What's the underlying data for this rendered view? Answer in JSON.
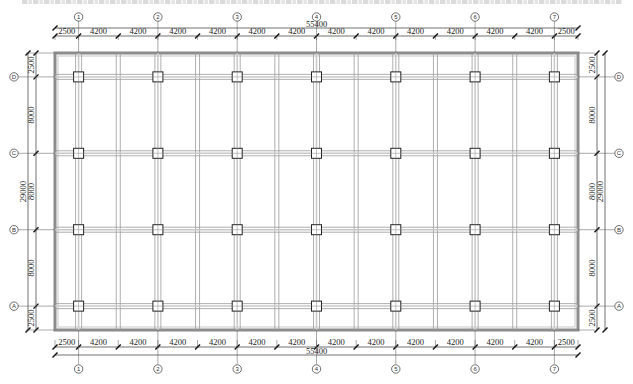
{
  "drawing": {
    "type": "structural floor grid plan",
    "colors": {
      "line": "#333333",
      "beam": "#9a9a9a",
      "beam_light": "#c8c8c8",
      "slab_edge": "#8c8c8c",
      "column": "#222222",
      "text": "#222222"
    },
    "x_axes": [
      "1",
      "2",
      "3",
      "4",
      "5",
      "6",
      "7"
    ],
    "y_axes": [
      "D",
      "C",
      "B",
      "A"
    ],
    "top_dimensions": {
      "segments": [
        "2500",
        "4200",
        "4200",
        "4200",
        "4200",
        "4200",
        "4200",
        "4200",
        "4200",
        "4200",
        "4200",
        "4200",
        "4200",
        "2500"
      ],
      "total": "55400"
    },
    "bottom_dimensions": {
      "segments": [
        "2500",
        "4200",
        "4200",
        "4200",
        "4200",
        "4200",
        "4200",
        "4200",
        "4200",
        "4200",
        "4200",
        "4200",
        "4200",
        "2500"
      ],
      "total": "55400"
    },
    "left_dimensions": {
      "segments": [
        "2500",
        "8000",
        "8000",
        "8000",
        "2500"
      ],
      "total": "29000"
    },
    "right_dimensions": {
      "segments": [
        "2500",
        "8000",
        "8000",
        "8000",
        "2500"
      ],
      "total": "29000"
    }
  }
}
